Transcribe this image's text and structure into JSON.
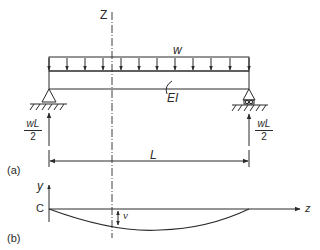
{
  "figure": {
    "part_a": {
      "panel_label": "(a)",
      "axis_label": "Z",
      "load_label": "w",
      "stiffness_label": "EI",
      "span_label": "L",
      "left_reaction": {
        "numerator": "wL",
        "denominator": "2"
      },
      "right_reaction": {
        "numerator": "wL",
        "denominator": "2"
      },
      "load_arrow_count": 11,
      "left_support": "pin",
      "right_support": "roller"
    },
    "part_b": {
      "panel_label": "(b)",
      "y_axis_label": "y",
      "z_axis_label": "z",
      "origin_label": "C",
      "deflection_label": "v"
    },
    "colors": {
      "line": "#2a2a2a",
      "background": "#ffffff"
    }
  }
}
